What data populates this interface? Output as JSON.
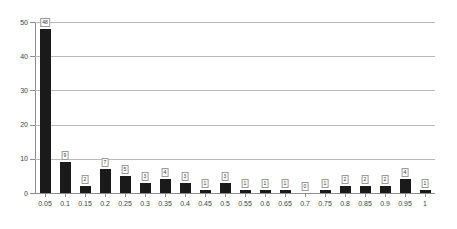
{
  "chart_data": {
    "type": "bar",
    "title": "",
    "subtitle": "",
    "xlabel": "",
    "ylabel": "",
    "ylim": [
      0,
      50
    ],
    "y_ticks": [
      0,
      10,
      20,
      30,
      40,
      50
    ],
    "grid": true,
    "legend": null,
    "legend_position": "none",
    "bar_color": "#1a1a1a",
    "gridline_color": "#b9b9b9",
    "axis_color": "#8d8d8d",
    "show_data_labels": true,
    "categories": [
      "0.05",
      "0.1",
      "0.15",
      "0.2",
      "0.25",
      "0.3",
      "0.35",
      "0.4",
      "0.45",
      "0.5",
      "0.55",
      "0.6",
      "0.65",
      "0.7",
      "0.75",
      "0.8",
      "0.85",
      "0.9",
      "0.95",
      "1"
    ],
    "values": [
      48,
      9,
      2,
      7,
      5,
      3,
      4,
      3,
      1,
      3,
      1,
      1,
      1,
      0,
      1,
      2,
      2,
      2,
      4,
      1
    ],
    "data_labels": [
      "48",
      "9",
      "2",
      "7",
      "5",
      "3",
      "4",
      "3",
      "1",
      "3",
      "1",
      "1",
      "1",
      "0",
      "1",
      "2",
      "2",
      "2",
      "4",
      "1"
    ]
  }
}
